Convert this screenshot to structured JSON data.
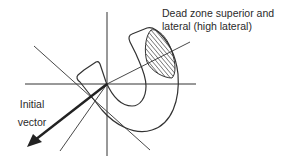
{
  "diagram": {
    "type": "vectorcardiogram loop on hexaxial reference",
    "labels": {
      "dead_zone_line1": "Dead zone superior and",
      "dead_zone_line2": "lateral (high lateral)",
      "initial_vector_line1": "Initial",
      "initial_vector_line2": "vector"
    },
    "colors": {
      "line": "#333333",
      "thick_arrow": "#222222",
      "hatch": "#3a3a3a",
      "background": "#ffffff"
    },
    "elements": [
      "vertical-axis",
      "horizontal-axis",
      "oblique-axis-upper-left-lower-right",
      "oblique-axis-upper-right",
      "oblique-axis-lower-left",
      "u-shaped-loop",
      "hatched-dead-zone",
      "initial-vector-arrow"
    ]
  }
}
